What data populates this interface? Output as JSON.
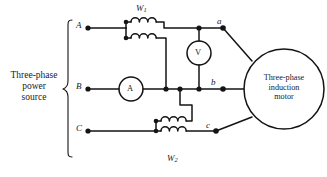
{
  "diagram": {
    "stroke_color": "#141414",
    "text_color": "#1a1a1a",
    "background": "#ffffff"
  },
  "source": {
    "label_line1": "Three-phase",
    "label_line2": "power",
    "label_line3": "source",
    "brace": "{"
  },
  "supply_terminals": [
    {
      "id": "A",
      "label": "A"
    },
    {
      "id": "B",
      "label": "B"
    },
    {
      "id": "C",
      "label": "C"
    }
  ],
  "motor_terminals": [
    {
      "id": "a",
      "label": "a"
    },
    {
      "id": "b",
      "label": "b"
    },
    {
      "id": "c",
      "label": "c"
    }
  ],
  "wattmeters": [
    {
      "id": "W1",
      "label": "W",
      "subscript": "1"
    },
    {
      "id": "W2",
      "label": "W",
      "subscript": "2"
    }
  ],
  "meters": [
    {
      "id": "voltmeter",
      "label": "V"
    },
    {
      "id": "ammeter",
      "label": "A"
    }
  ],
  "motor": {
    "label_line1": "Three-phase",
    "label_line2": "induction",
    "label_line3": "motor"
  }
}
